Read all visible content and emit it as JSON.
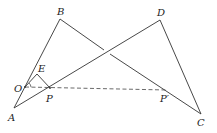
{
  "diagram": {
    "type": "geometry-figure",
    "points": {
      "A": {
        "label": "A",
        "x": 14,
        "y": 108,
        "lx": 8,
        "ly": 121
      },
      "B": {
        "label": "B",
        "x": 60,
        "y": 19,
        "lx": 57,
        "ly": 15
      },
      "C": {
        "label": "C",
        "x": 201,
        "y": 114,
        "lx": 197,
        "ly": 126
      },
      "D": {
        "label": "D",
        "x": 160,
        "y": 20,
        "lx": 157,
        "ly": 16
      },
      "O": {
        "label": "O",
        "x": 25,
        "y": 87,
        "lx": 14,
        "ly": 92
      },
      "E": {
        "label": "E",
        "x": 37,
        "y": 74,
        "lx": 38,
        "ly": 72
      },
      "P": {
        "label": "P",
        "x": 50,
        "y": 88,
        "lx": 46,
        "ly": 102
      },
      "P_prime": {
        "label": "P′",
        "x": 167,
        "y": 90,
        "lx": 160,
        "ly": 102
      }
    },
    "segments": [
      "AB",
      "BC",
      "AD",
      "DC",
      "OE",
      "EP"
    ],
    "dashed_segments": [
      "OP′"
    ],
    "angle_marks": [
      "arc at O between OE and OP"
    ]
  }
}
